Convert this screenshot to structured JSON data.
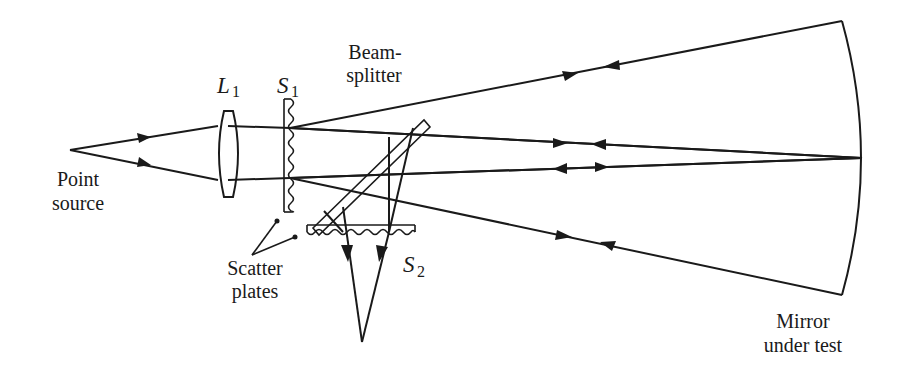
{
  "diagram": {
    "type": "optical-schematic",
    "labels": {
      "point_source_line1": "Point",
      "point_source_line2": "source",
      "lens": "L",
      "lens_sub": "1",
      "scatter_plate_1": "S",
      "scatter_plate_1_sub": "1",
      "scatter_plate_2": "S",
      "scatter_plate_2_sub": "2",
      "beamsplitter_line1": "Beam-",
      "beamsplitter_line2": "splitter",
      "scatter_plates_line1": "Scatter",
      "scatter_plates_line2": "plates",
      "mirror_line1": "Mirror",
      "mirror_line2": "under test"
    },
    "components": [
      {
        "name": "point-source",
        "x": 70,
        "y": 150
      },
      {
        "name": "lens-L1",
        "x": 228,
        "y_top": 112,
        "y_bottom": 196
      },
      {
        "name": "scatter-plate-S1",
        "x": 287,
        "y_top": 98,
        "y_bottom": 213
      },
      {
        "name": "beamsplitter",
        "x1": 314,
        "y1": 232,
        "x2": 428,
        "y2": 123
      },
      {
        "name": "scatter-plate-S2",
        "x_left": 307,
        "x_right": 415,
        "y": 225
      },
      {
        "name": "mirror-under-test",
        "top": [
          842,
          21
        ],
        "vertex": [
          862,
          158
        ],
        "bottom": [
          842,
          295
        ]
      },
      {
        "name": "image-point",
        "x": 362,
        "y": 342
      }
    ],
    "stroke_color": "#1a1a1a",
    "background": "#ffffff"
  }
}
